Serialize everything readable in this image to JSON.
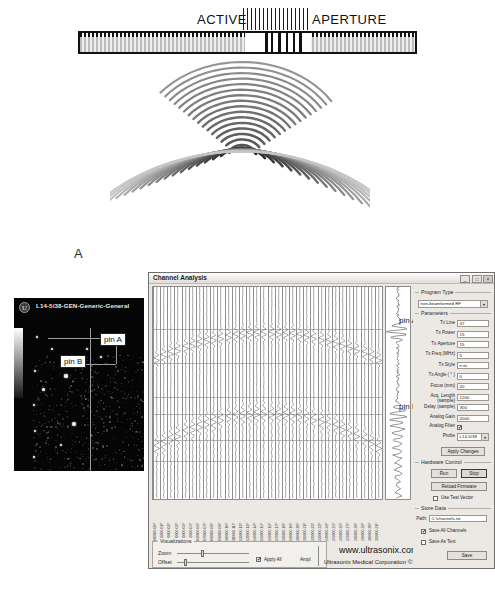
{
  "figure": {
    "label_a": "A",
    "label_b": "B"
  },
  "panel_a": {
    "label_active": "ACTIVE",
    "label_aperture": "APERTURE",
    "transducer_name": "transducer-array",
    "wavefront_name": "ultrasound-wavefront-arcs"
  },
  "ultrasound_image": {
    "logo": "U",
    "probe_label": "L14-5/38-GEN-Generic-General",
    "callout_pin_a": "pin A",
    "callout_pin_b": "pin B",
    "callout_line": "Ultrasound line"
  },
  "window": {
    "title": "Channel Analysis",
    "minimize": "_",
    "maximize": "□",
    "close": "×"
  },
  "plot": {
    "overlay_pin_a": "pin A",
    "overlay_pin_b": "pin B",
    "channel_labels": [
      "000000-00P",
      "010000-01P",
      "020000-02P",
      "030000-03P",
      "040000-04P",
      "050000-05P",
      "060000-06P",
      "070000-07P",
      "080000-08P",
      "090000-09P",
      "100000-10P",
      "110000-11P",
      "120000-12P",
      "130000-13P",
      "140000-14P",
      "150000-15P",
      "160000-16P",
      "170000-17P",
      "180000-18P",
      "190000-19P",
      "200000-20P",
      "210000-21P",
      "220000-22P",
      "230000-23P",
      "240000-24P",
      "250000-25P",
      "260000-26P",
      "270000-27P",
      "280000-28P",
      "290000-29P",
      "300000-30P",
      "310000-31P"
    ]
  },
  "program_type": {
    "legend": "Program Type",
    "value": "non-beamformed RF"
  },
  "parameters": {
    "legend": "Parameters",
    "rows": [
      {
        "label": "Tx Line",
        "value": "47"
      },
      {
        "label": "Tx Power",
        "value": "15"
      },
      {
        "label": "Tx Aperture",
        "value": "15"
      },
      {
        "label": "Tx Freq (MHz)",
        "value": "5"
      },
      {
        "label": "Tx Style",
        "value": "n.m."
      },
      {
        "label": "Tx Angle ( ° )",
        "value": "0"
      },
      {
        "label": "Focus (mm)",
        "value": "20"
      },
      {
        "label": "Acq. Length (sample)",
        "value": "1200"
      },
      {
        "label": "Delay (sample)",
        "value": "300"
      },
      {
        "label": "Analog Gain",
        "value": "2000"
      }
    ],
    "analog_filter_label": "Analog Filter",
    "analog_filter_checked": true,
    "probe_label": "Probe",
    "probe_value": "L14-5/38",
    "apply_changes": "Apply Changes"
  },
  "hardware_control": {
    "legend": "Hardware Control",
    "run": "Run",
    "stop": "Stop",
    "reload_firmware": "Reload Firmware",
    "use_test_vector": "Use Test Vector",
    "use_test_vector_checked": false
  },
  "store_data": {
    "legend": "Store Data",
    "path_label": "Path:",
    "path_value": "C:\\channels.txt",
    "save_all_channels": "Save All Channels",
    "save_all_channels_checked": true,
    "save_as_text": "Save As Text",
    "save_as_text_checked": false,
    "save": "Save"
  },
  "visualizations": {
    "legend": "Visualizations",
    "zoom_label": "Zoom",
    "offset_label": "Offset",
    "apply_all_label": "Apply All",
    "apply_all_checked": true,
    "ampl_label": "Ampl"
  },
  "footer": {
    "website": "www.ultrasonix.com",
    "copyright": "Ultrasonix Medical Corporation ©1999-2005"
  },
  "colors": {
    "window_bg": "#ece9e4",
    "plot_bg": "#ffffff",
    "ink": "#111111",
    "wave_light": "#b9b9b9",
    "wave_dark": "#5a5a5a"
  }
}
